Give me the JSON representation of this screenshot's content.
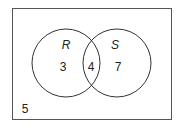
{
  "diagram": {
    "type": "venn",
    "universe_count": "5",
    "sets": [
      {
        "label": "R",
        "only_count": "3"
      },
      {
        "label": "S",
        "only_count": "7"
      }
    ],
    "intersection_count": "4",
    "colors": {
      "stroke": "#333333",
      "background": "#ffffff"
    }
  }
}
